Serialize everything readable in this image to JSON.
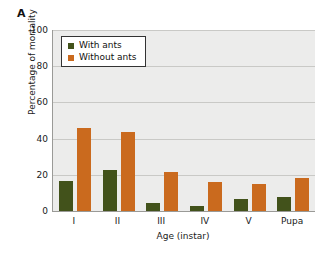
{
  "panel": {
    "letter": "A"
  },
  "legend": {
    "position": "top-left",
    "entries": [
      {
        "label": "With ants",
        "color": "#42521b",
        "swatch": "square-swatch-icon"
      },
      {
        "label": "Without ants",
        "color": "#ca6a1e",
        "swatch": "square-swatch-icon"
      }
    ]
  },
  "axes": {
    "ylabel": "Percentage of mortality",
    "xlabel": "Age (instar)",
    "yticks": [
      "0",
      "20",
      "40",
      "60",
      "80",
      "100"
    ],
    "xticks": [
      "I",
      "II",
      "III",
      "IV",
      "V",
      "Pupa"
    ]
  },
  "colors": {
    "with_ants": "#42521b",
    "without_ants": "#ca6a1e",
    "plot_background": "#ececeb",
    "gridline": "#c9c9c6",
    "axis": "#9a9a97",
    "legend_border": "#333333"
  },
  "chart_data": {
    "type": "bar",
    "title": "A",
    "xlabel": "Age (instar)",
    "ylabel": "Percentage of mortality",
    "categories": [
      "I",
      "II",
      "III",
      "IV",
      "V",
      "Pupa"
    ],
    "series": [
      {
        "name": "With ants",
        "color": "#42521b",
        "values": [
          16.5,
          22.5,
          4.5,
          2.5,
          6.5,
          7.5
        ]
      },
      {
        "name": "Without ants",
        "color": "#ca6a1e",
        "values": [
          46,
          43.5,
          21.5,
          16,
          15,
          18.5
        ]
      }
    ],
    "ylim": [
      0,
      100
    ],
    "ytick_step": 20,
    "grid": true,
    "legend_position": "top-left"
  }
}
